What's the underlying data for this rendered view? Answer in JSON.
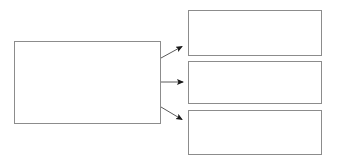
{
  "diagram": {
    "type": "flowchart",
    "title": "",
    "canvas": {
      "width": 339,
      "height": 165,
      "background": "#ffffff"
    },
    "style": {
      "box_border_color": "#8c8c8c",
      "box_fill_color": "#ffffff",
      "connector_color": "#5a5a5a",
      "arrowhead_color": "#1a1a1a",
      "box_border_width_px": 1,
      "connector_width_px": 1
    },
    "nodes": [
      {
        "id": "source-box",
        "label": "",
        "x": 14,
        "y": 41,
        "width": 147,
        "height": 83
      },
      {
        "id": "target-box-1",
        "label": "",
        "x": 188,
        "y": 10,
        "width": 134,
        "height": 46
      },
      {
        "id": "target-box-2",
        "label": "",
        "x": 188,
        "y": 61,
        "width": 134,
        "height": 43
      },
      {
        "id": "target-box-3",
        "label": "",
        "x": 188,
        "y": 110,
        "width": 134,
        "height": 45
      }
    ],
    "connectors": [
      {
        "id": "arrow-source-to-target-1",
        "label": "",
        "from": "source-box",
        "to": "target-box-1",
        "x1": 161,
        "y1": 58,
        "x2": 185,
        "y2": 45,
        "direction": "up-right",
        "arrowhead": "filled-triangle"
      },
      {
        "id": "arrow-source-to-target-2",
        "label": "",
        "from": "source-box",
        "to": "target-box-2",
        "x1": 161,
        "y1": 82,
        "x2": 187,
        "y2": 82,
        "direction": "right",
        "arrowhead": "filled-triangle"
      },
      {
        "id": "arrow-source-to-target-3",
        "label": "",
        "from": "source-box",
        "to": "target-box-3",
        "x1": 161,
        "y1": 107,
        "x2": 185,
        "y2": 121,
        "direction": "down-right",
        "arrowhead": "filled-triangle"
      }
    ]
  }
}
